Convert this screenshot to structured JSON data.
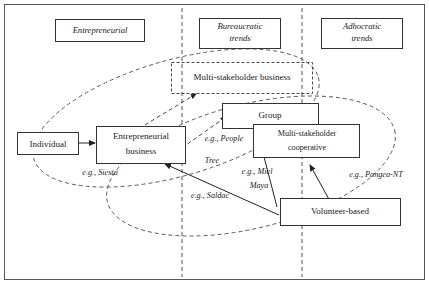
{
  "diagram": {
    "frame": {
      "present": true
    },
    "columns": [
      {
        "id": "entrepreneurial",
        "label": "Entrepreneurial",
        "lines": [
          "Entrepreneurial"
        ]
      },
      {
        "id": "bureaucratic",
        "label": "Bureaucratic trends",
        "lines": [
          "Bureaucratic",
          "trends"
        ]
      },
      {
        "id": "adhocratic",
        "label": "Adhocratic trends",
        "lines": [
          "Adhocratic",
          "trends"
        ]
      }
    ],
    "nodes": [
      {
        "id": "individual",
        "label": "Individual",
        "lines": [
          "Individual"
        ],
        "style": "solid"
      },
      {
        "id": "entrepreneurial-business",
        "label": "Entrepreneurial business",
        "lines": [
          "Entrepreneurial",
          "business"
        ],
        "style": "solid"
      },
      {
        "id": "multi-stakeholder-business",
        "label": "Multi-stakeholder business",
        "lines": [
          "Multi-stakeholder business"
        ],
        "style": "dashed"
      },
      {
        "id": "group",
        "label": "Group",
        "lines": [
          "Group"
        ],
        "style": "solid"
      },
      {
        "id": "multi-stakeholder-cooperative",
        "label": "Multi-stakeholder cooperative",
        "lines": [
          "Multi-stakeholder",
          "cooperative"
        ],
        "style": "solid"
      },
      {
        "id": "volunteer-based",
        "label": "Volunteer-based",
        "lines": [
          "Volunteer-based"
        ],
        "style": "solid"
      }
    ],
    "examples": [
      {
        "id": "siesta",
        "label": "e.g., Siesta",
        "lines": [
          "e.g., Siesta"
        ]
      },
      {
        "id": "people-tree",
        "label": "e.g., People Tree",
        "lines": [
          "e.g., People",
          "Tree"
        ]
      },
      {
        "id": "miel-maya",
        "label": "e.g., Miel Maya",
        "lines": [
          "e.g., Miel",
          "Maya"
        ]
      },
      {
        "id": "saldac",
        "label": "e.g., Saldac",
        "lines": [
          "e.g., Saldac"
        ]
      },
      {
        "id": "pangea-nt",
        "label": "e.g., Pangea-NT",
        "lines": [
          "e.g., Pangea-NT"
        ]
      }
    ],
    "ellipses": [
      {
        "id": "upper-ellipse",
        "style": "dashed"
      },
      {
        "id": "lower-ellipse",
        "style": "dashed"
      }
    ],
    "dividers": [
      {
        "id": "divider-left",
        "style": "dashed"
      },
      {
        "id": "divider-right",
        "style": "dashed"
      }
    ],
    "colors": {
      "stroke": "#333333",
      "text": "#1a1a1a",
      "background": "#ffffff",
      "dashed_stroke": "#555555"
    }
  }
}
